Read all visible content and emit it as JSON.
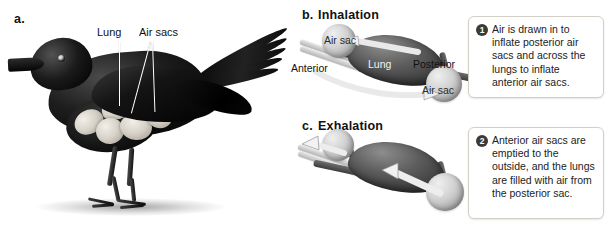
{
  "figure": {
    "panels": [
      {
        "id": "a",
        "letter": "a.",
        "heading": "",
        "labels": [
          {
            "name": "lung",
            "text": "Lung"
          },
          {
            "name": "air-sacs",
            "text": "Air sacs"
          }
        ]
      },
      {
        "id": "b",
        "letter": "b.",
        "heading": "Inhalation",
        "labels": [
          {
            "name": "anterior",
            "text": "Anterior"
          },
          {
            "name": "posterior",
            "text": "Posterior"
          },
          {
            "name": "air-sac-anterior",
            "text": "Air sac"
          },
          {
            "name": "air-sac-posterior",
            "text": "Air sac"
          },
          {
            "name": "lung",
            "text": "Lung"
          }
        ],
        "callout": {
          "number": "1",
          "text": "Air is drawn in to inflate posterior air sacs and across the lungs to inflate anterior air sacs."
        }
      },
      {
        "id": "c",
        "letter": "c.",
        "heading": "Exhalation",
        "labels": [],
        "callout": {
          "number": "2",
          "text": "Anterior air sacs are emptied to the outside, and the lungs are filled with air from the posterior sac."
        }
      }
    ]
  },
  "colors": {
    "badge": "#3d3a36",
    "callout_border": "#d3cfc7",
    "lung_dark": "#4a4a4a",
    "air_sac_light": "#d9d9d9",
    "background": "#ffffff"
  }
}
